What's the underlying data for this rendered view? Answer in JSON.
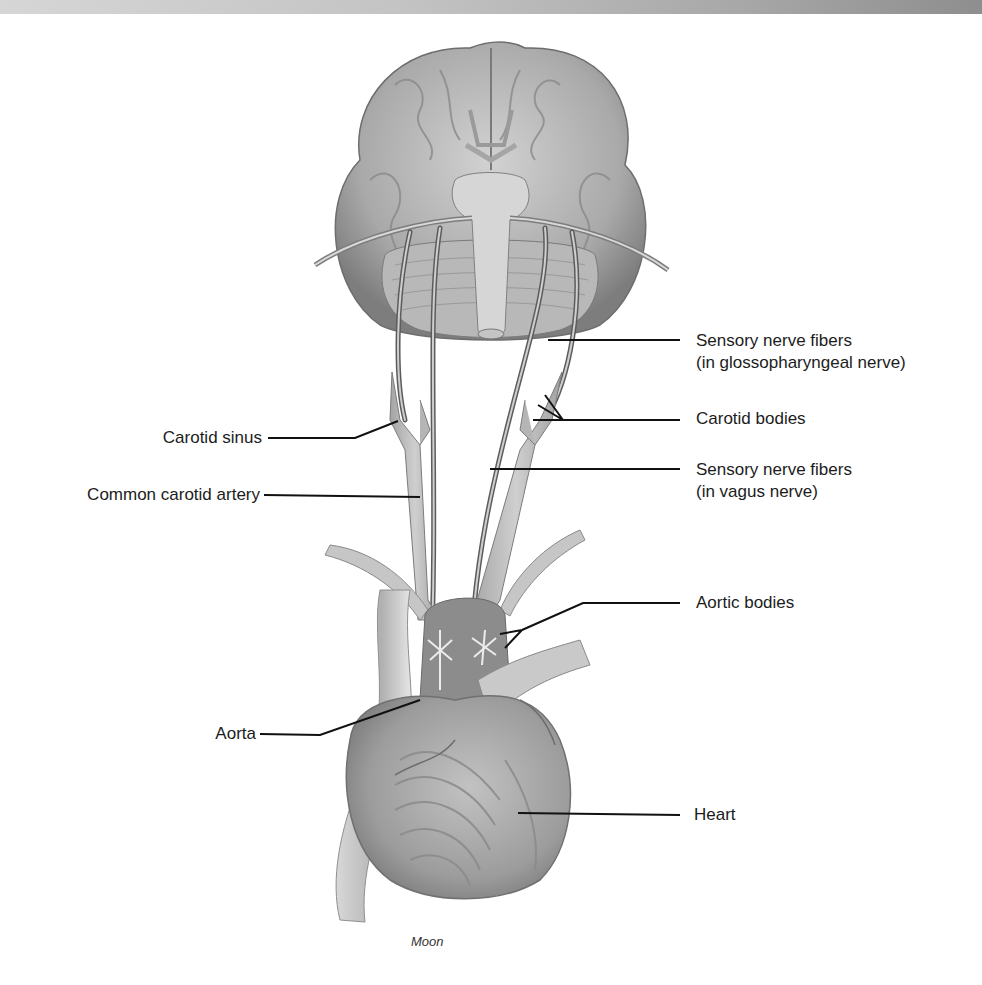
{
  "figure": {
    "top_bar_color_start": "#d6d6d6",
    "top_bar_color_end": "#8e8e8e",
    "illustration_tone": "#9a9a9a",
    "leader_line_color": "#111111"
  },
  "labels": {
    "sensory_glosso_line1": "Sensory nerve fibers",
    "sensory_glosso_line2": "(in glossopharyngeal nerve)",
    "carotid_bodies": "Carotid bodies",
    "sensory_vagus_line1": "Sensory nerve fibers",
    "sensory_vagus_line2": "(in vagus nerve)",
    "carotid_sinus": "Carotid sinus",
    "common_carotid_artery": "Common carotid artery",
    "aortic_bodies": "Aortic bodies",
    "aorta": "Aorta",
    "heart": "Heart"
  },
  "signature": "Moon"
}
